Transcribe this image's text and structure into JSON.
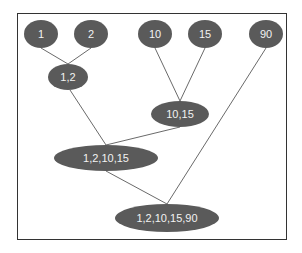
{
  "diagram": {
    "type": "hierarchical-clustering-tree",
    "colors": {
      "node_fill": "#5a5a5a",
      "node_text": "#f2f2f2",
      "edge": "#6a6a6a",
      "frame": "#333333"
    },
    "nodes": [
      {
        "id": "n1",
        "label": "1",
        "cx": 41,
        "cy": 34,
        "rx": 17,
        "ry": 14
      },
      {
        "id": "n2",
        "label": "2",
        "cx": 91,
        "cy": 34,
        "rx": 17,
        "ry": 14
      },
      {
        "id": "n10",
        "label": "10",
        "cx": 155,
        "cy": 34,
        "rx": 17,
        "ry": 14
      },
      {
        "id": "n15",
        "label": "15",
        "cx": 205,
        "cy": 34,
        "rx": 17,
        "ry": 14
      },
      {
        "id": "n90",
        "label": "90",
        "cx": 266,
        "cy": 34,
        "rx": 17,
        "ry": 14
      },
      {
        "id": "n1_2",
        "label": "1,2",
        "cx": 68,
        "cy": 77,
        "rx": 20,
        "ry": 13
      },
      {
        "id": "n10_15",
        "label": "10,15",
        "cx": 180,
        "cy": 114,
        "rx": 29,
        "ry": 13
      },
      {
        "id": "n1_2_10_15",
        "label": "1,2,10,15",
        "cx": 106,
        "cy": 158,
        "rx": 52,
        "ry": 13
      },
      {
        "id": "n1_2_10_15_90",
        "label": "1,2,10,15,90",
        "cx": 167,
        "cy": 218,
        "rx": 52,
        "ry": 14
      }
    ],
    "edges": [
      {
        "from": "n1",
        "to": "n1_2",
        "x1": 41,
        "y1": 48,
        "x2": 68,
        "y2": 64
      },
      {
        "from": "n2",
        "to": "n1_2",
        "x1": 91,
        "y1": 48,
        "x2": 68,
        "y2": 64
      },
      {
        "from": "n10",
        "to": "n10_15",
        "x1": 155,
        "y1": 48,
        "x2": 180,
        "y2": 101
      },
      {
        "from": "n15",
        "to": "n10_15",
        "x1": 205,
        "y1": 48,
        "x2": 180,
        "y2": 101
      },
      {
        "from": "n1_2",
        "to": "n1_2_10_15",
        "x1": 70,
        "y1": 90,
        "x2": 106,
        "y2": 145
      },
      {
        "from": "n10_15",
        "to": "n1_2_10_15",
        "x1": 180,
        "y1": 127,
        "x2": 106,
        "y2": 145
      },
      {
        "from": "n1_2_10_15",
        "to": "n1_2_10_15_90",
        "x1": 106,
        "y1": 171,
        "x2": 167,
        "y2": 204
      },
      {
        "from": "n90",
        "to": "n1_2_10_15_90",
        "x1": 266,
        "y1": 48,
        "x2": 167,
        "y2": 204
      }
    ]
  }
}
